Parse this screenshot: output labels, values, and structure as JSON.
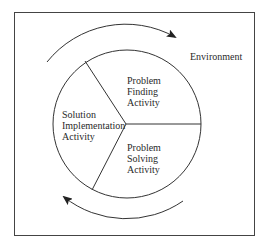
{
  "diagram": {
    "environment_label": "Environment",
    "segments": [
      {
        "id": "problem-finding",
        "lines": [
          "Problem",
          "Finding",
          "Activity"
        ]
      },
      {
        "id": "solution-implementation",
        "lines": [
          "Solution",
          "Implementation",
          "Activity"
        ]
      },
      {
        "id": "problem-solving",
        "lines": [
          "Problem",
          "Solving",
          "Activity"
        ]
      }
    ],
    "cycle_direction": "clockwise",
    "colors": {
      "stroke": "#333333",
      "text": "#2a2a2a",
      "background": "#ffffff"
    }
  }
}
